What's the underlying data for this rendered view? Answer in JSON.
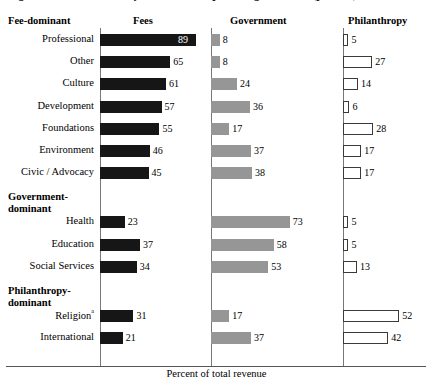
{
  "figure": {
    "title_fragment": "Figure  Revenue sources by subsector, nonprofit organizations (percent)",
    "x_axis_caption": "Percent of total revenue",
    "footnote_marker": "a"
  },
  "headers": {
    "group_column": "Fee-dominant",
    "fees": "Fees",
    "government": "Government",
    "philanthropy": "Philanthropy"
  },
  "groups": [
    {
      "id": "fee-dominant",
      "label_line1": "Fee-dominant",
      "label_line2": ""
    },
    {
      "id": "government-dominant",
      "label_line1": "Government-",
      "label_line2": "dominant"
    },
    {
      "id": "philanthropy-dominant",
      "label_line1": "Philanthropy-",
      "label_line2": "dominant"
    }
  ],
  "colors": {
    "fees_bar": "#161616",
    "government_bar": "#969696",
    "philanthropy_bar_fill": "#ffffff",
    "philanthropy_bar_stroke": "#3a3a3a",
    "axis": "#777777",
    "text": "#000000",
    "inside_label": "#ffffff"
  },
  "chart_data": {
    "type": "bar",
    "title": "Revenue sources by subsector, nonprofit organizations (percent)",
    "xlabel": "Percent of total revenue",
    "ylabel": "",
    "xlim": [
      0,
      100
    ],
    "grid": false,
    "legend": "column-headers",
    "orientation": "horizontal",
    "categories": [
      "Professional",
      "Other",
      "Culture",
      "Development",
      "Foundations",
      "Environment",
      "Civic / Advocacy",
      "Health",
      "Education",
      "Social Services",
      "Religion",
      "International"
    ],
    "series": [
      {
        "name": "Fees",
        "values": [
          89,
          65,
          61,
          57,
          55,
          46,
          45,
          23,
          37,
          34,
          31,
          21
        ]
      },
      {
        "name": "Government",
        "values": [
          8,
          8,
          24,
          36,
          17,
          37,
          38,
          73,
          58,
          53,
          17,
          37
        ]
      },
      {
        "name": "Philanthropy",
        "values": [
          5,
          27,
          14,
          6,
          28,
          17,
          17,
          5,
          5,
          13,
          52,
          42
        ]
      }
    ]
  },
  "rows": [
    {
      "label": "Professional",
      "sup": "",
      "group": "fee-dominant",
      "fees": 89,
      "government": 8,
      "philanthropy": 5
    },
    {
      "label": "Other",
      "sup": "",
      "group": "fee-dominant",
      "fees": 65,
      "government": 8,
      "philanthropy": 27
    },
    {
      "label": "Culture",
      "sup": "",
      "group": "fee-dominant",
      "fees": 61,
      "government": 24,
      "philanthropy": 14
    },
    {
      "label": "Development",
      "sup": "",
      "group": "fee-dominant",
      "fees": 57,
      "government": 36,
      "philanthropy": 6
    },
    {
      "label": "Foundations",
      "sup": "",
      "group": "fee-dominant",
      "fees": 55,
      "government": 17,
      "philanthropy": 28
    },
    {
      "label": "Environment",
      "sup": "",
      "group": "fee-dominant",
      "fees": 46,
      "government": 37,
      "philanthropy": 17
    },
    {
      "label": "Civic / Advocacy",
      "sup": "",
      "group": "fee-dominant",
      "fees": 45,
      "government": 38,
      "philanthropy": 17
    },
    {
      "label": "Health",
      "sup": "",
      "group": "government-dominant",
      "fees": 23,
      "government": 73,
      "philanthropy": 5
    },
    {
      "label": "Education",
      "sup": "",
      "group": "government-dominant",
      "fees": 37,
      "government": 58,
      "philanthropy": 5
    },
    {
      "label": "Social Services",
      "sup": "",
      "group": "government-dominant",
      "fees": 34,
      "government": 53,
      "philanthropy": 13
    },
    {
      "label": "Religion",
      "sup": "a",
      "group": "philanthropy-dominant",
      "fees": 31,
      "government": 17,
      "philanthropy": 52
    },
    {
      "label": "International",
      "sup": "",
      "group": "philanthropy-dominant",
      "fees": 21,
      "government": 37,
      "philanthropy": 42
    }
  ]
}
